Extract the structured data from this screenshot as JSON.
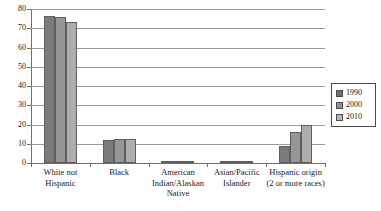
{
  "chart_data": {
    "type": "bar",
    "title": "",
    "subtitle": "",
    "xlabel": "",
    "ylabel": "",
    "ylim": [
      0,
      80
    ],
    "ytick_step": 10,
    "yticks": [
      80,
      70,
      60,
      50,
      40,
      30,
      20,
      10,
      0
    ],
    "grid": true,
    "legend_position": "right",
    "categories": [
      "White not Hispanic",
      "Black",
      "American Indian/Alaskan Native",
      "Asian/Pacific Islander",
      "Hispanic origin (2 or more races)"
    ],
    "category_lines": [
      [
        "White not",
        "Hispanic"
      ],
      [
        "Black"
      ],
      [
        "American",
        "Indian/Alaskan",
        "Native"
      ],
      [
        "Asian/Pacific",
        "Islander"
      ],
      [
        "Hispanic origin",
        "(2 or more races)"
      ]
    ],
    "series": [
      {
        "name": "1990",
        "color": "#7b7b7b",
        "values": [
          76.5,
          12.0,
          0.8,
          0.8,
          9.0
        ]
      },
      {
        "name": "2000",
        "color": "#969696",
        "values": [
          76.0,
          12.3,
          0.9,
          1.2,
          16.0
        ]
      },
      {
        "name": "2010",
        "color": "#adadad",
        "values": [
          73.0,
          12.6,
          1.0,
          1.3,
          20.0
        ]
      }
    ]
  },
  "legend": {
    "entries": [
      {
        "label": "1990",
        "color": "#6f6f6f"
      },
      {
        "label": "2000",
        "color": "#919191"
      },
      {
        "label": "2010",
        "color": "#b4b4b4"
      }
    ]
  },
  "colors": {
    "axis": "#6e6e6e",
    "gridline": "#9a9a9a",
    "background": "#ffffff",
    "text": "#1a1a1a"
  }
}
